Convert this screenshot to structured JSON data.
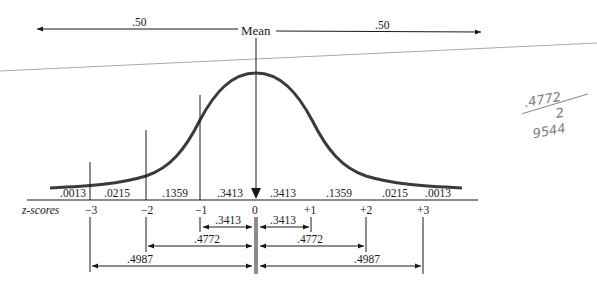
{
  "diagram": {
    "top_label": "Mean",
    "top_halves": [
      {
        "label": ".50",
        "side": "left"
      },
      {
        "label": ".50",
        "side": "right"
      }
    ],
    "z_axis_label": "z-scores",
    "z_ticks": [
      "−3",
      "−2",
      "−1",
      "0",
      "+1",
      "+2",
      "+3"
    ],
    "segment_areas": [
      ".0013",
      ".0215",
      ".1359",
      ".3413",
      ".3413",
      ".1359",
      ".0215",
      ".0013"
    ],
    "cumulative_spans": [
      {
        "from": "-1",
        "to": "0",
        "label": ".3413"
      },
      {
        "from": "0",
        "to": "+1",
        "label": ".3413"
      },
      {
        "from": "-2",
        "to": "0",
        "label": ".4772"
      },
      {
        "from": "0",
        "to": "+2",
        "label": ".4772"
      },
      {
        "from": "-3",
        "to": "0",
        "label": ".4987"
      },
      {
        "from": "0",
        "to": "+3",
        "label": ".4987"
      }
    ],
    "handwritten_note": {
      "line1": ".4772",
      "line2": "2",
      "line3": "9544"
    }
  },
  "colors": {
    "ink": "#1a1a1a",
    "curve": "#3a3a3a",
    "stray_line": "#a8a8a8",
    "handwriting": "#8a8a8a"
  }
}
